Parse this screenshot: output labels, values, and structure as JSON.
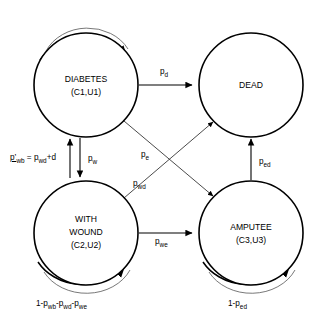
{
  "diagram": {
    "type": "state-transition-diagram",
    "background_color": "#ffffff",
    "stroke_color": "#000000",
    "states": [
      {
        "id": "diabetes",
        "lines": [
          "DIABETES",
          "(C1,U1)"
        ],
        "line1": "DIABETES",
        "line2": "(C1,U1)",
        "cx": 86,
        "cy": 85,
        "r": 52
      },
      {
        "id": "dead",
        "lines": [
          "DEAD"
        ],
        "line1": "DEAD",
        "line2": "",
        "cx": 251,
        "cy": 85,
        "r": 52
      },
      {
        "id": "with-wound",
        "lines": [
          "WITH",
          "WOUND",
          "(C2,U2)"
        ],
        "line1": "WITH",
        "line2": "WOUND",
        "line3": "(C2,U2)",
        "cx": 86,
        "cy": 233,
        "r": 52
      },
      {
        "id": "amputee",
        "lines": [
          "AMPUTEE",
          "(C3,U3)"
        ],
        "line1": "AMPUTEE",
        "line2": "(C3,U3)",
        "cx": 251,
        "cy": 233,
        "r": 52
      }
    ],
    "transitions": [
      {
        "id": "diabetes-to-dead",
        "from": "diabetes",
        "to": "dead",
        "base": "p",
        "subscript": "d",
        "label": "pd"
      },
      {
        "id": "diabetes-to-with-wound",
        "from": "diabetes",
        "to": "with-wound",
        "base": "p",
        "subscript": "w",
        "label": "pw"
      },
      {
        "id": "with-wound-to-diabetes",
        "from": "with-wound",
        "to": "diabetes",
        "base": "p",
        "subscript": "wb",
        "label": "p'wb = pwd+d"
      },
      {
        "id": "with-wound-to-dead",
        "from": "with-wound",
        "to": "dead",
        "base": "p",
        "subscript": "e",
        "label": "pe"
      },
      {
        "id": "diabetes-to-amputee",
        "from": "diabetes",
        "to": "amputee",
        "base": "p",
        "subscript": "wd",
        "label": "pwd"
      },
      {
        "id": "with-wound-to-amputee",
        "from": "with-wound",
        "to": "amputee",
        "base": "p",
        "subscript": "we",
        "label": "pwe"
      },
      {
        "id": "amputee-to-dead",
        "from": "amputee",
        "to": "dead",
        "base": "p",
        "subscript": "ed",
        "label": "ped"
      }
    ],
    "self_loops": [
      {
        "id": "diabetes-self-loop",
        "state": "diabetes",
        "label": ""
      },
      {
        "id": "with-wound-self-loop",
        "state": "with-wound",
        "label": "1-pwb-pwd-pwe"
      },
      {
        "id": "amputee-self-loop",
        "state": "amputee",
        "label": "1-ped"
      }
    ],
    "labels": {
      "p_d": {
        "base": "p",
        "sub": "d"
      },
      "p_w": {
        "base": "p",
        "sub": "w"
      },
      "p_e": {
        "base": "p",
        "sub": "e"
      },
      "p_wd": {
        "base": "p",
        "sub": "wd"
      },
      "p_we": {
        "base": "p",
        "sub": "we"
      },
      "p_ed": {
        "base": "p",
        "sub": "ed"
      },
      "formula": {
        "lhs_base": "p’",
        "lhs_sub": "wb",
        "operator": " = ",
        "rhs_base": "p",
        "rhs_sub": "wd",
        "rhs_tail": "+d"
      },
      "loop_wound": {
        "prefix": "1-",
        "t1_base": "p",
        "t1_sub": "wb",
        "sep1": "-",
        "t2_base": "p",
        "t2_sub": "wd",
        "sep2": "-",
        "t3_base": "p",
        "t3_sub": "we"
      },
      "loop_amputee": {
        "prefix": "1-",
        "t1_base": "p",
        "t1_sub": "ed"
      }
    }
  }
}
